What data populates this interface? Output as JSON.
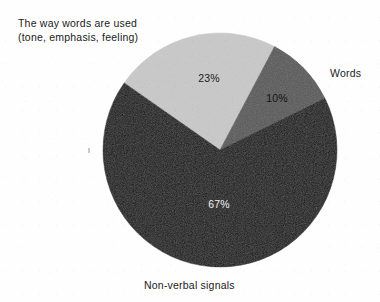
{
  "figure": {
    "background_color": "#fefefe",
    "width": 380,
    "height": 302
  },
  "labels": {
    "words_used": "The way words are used\n(tone, emphasis, feeling)",
    "words": "Words",
    "nonverbal": "Non-verbal signals"
  },
  "chart_data": {
    "type": "pie",
    "title": "",
    "subtitle": "",
    "xlabel": "",
    "ylabel": "",
    "legend_position": "callout-labels",
    "grid": false,
    "center": {
      "x": 220,
      "y": 150
    },
    "radius": 117,
    "start_angle_deg": -55,
    "direction": "clockwise",
    "categories": [
      "The way words are used (tone, emphasis, feeling)",
      "Words",
      "Non-verbal signals"
    ],
    "values": [
      23,
      10,
      67
    ],
    "value_labels": [
      "23%",
      "10%",
      "67%"
    ],
    "colors": [
      "#c9c9c9",
      "#585858",
      "#111111"
    ],
    "label_text_colors": [
      "#1b1b1b",
      "#101010",
      "#f2f2f2"
    ],
    "slices": [
      {
        "name": "The way words are used (tone, emphasis, feeling)",
        "value": 23,
        "value_label": "23%",
        "color": "#c9c9c9",
        "label_color": "#1b1b1b",
        "label_x": 209,
        "label_y": 82,
        "callout": "words_used"
      },
      {
        "name": "Words",
        "value": 10,
        "value_label": "10%",
        "color": "#585858",
        "label_color": "#121212",
        "label_x": 277,
        "label_y": 102,
        "callout": "words"
      },
      {
        "name": "Non-verbal signals",
        "value": 67,
        "value_label": "67%",
        "color": "#111111",
        "label_color": "#f2f2f2",
        "label_x": 219,
        "label_y": 208,
        "callout": "nonverbal"
      }
    ]
  }
}
